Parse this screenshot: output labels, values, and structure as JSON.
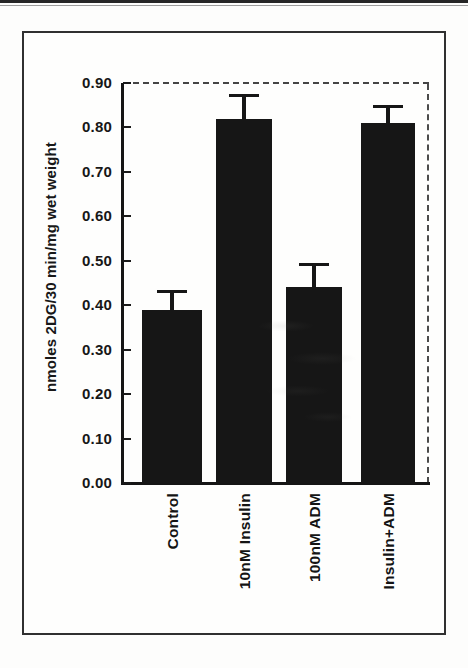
{
  "chart_data": {
    "type": "bar",
    "title": "",
    "categories": [
      "Control",
      "10nM Insulin",
      "100nM ADM",
      "Insulin+ADM"
    ],
    "values": [
      0.39,
      0.82,
      0.44,
      0.81
    ],
    "errors_plus": [
      0.04,
      0.05,
      0.05,
      0.035
    ],
    "xlabel": "",
    "ylabel": "nmoles 2DG/30 min/mg wet weight",
    "ylim": [
      0.0,
      0.9
    ],
    "y_tick_step": 0.1,
    "y_tick_labels": [
      "0.00",
      "0.10",
      "0.20",
      "0.30",
      "0.40",
      "0.50",
      "0.60",
      "0.70",
      "0.80",
      "0.90"
    ],
    "bar_color": "#161616",
    "error_bar_color": "#161616",
    "grid": "off",
    "legend": "none",
    "frame_style": "left and bottom solid; top and right dashed"
  }
}
